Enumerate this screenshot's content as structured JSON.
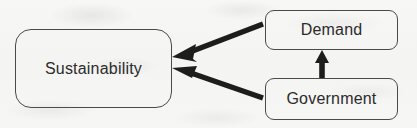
{
  "diagram": {
    "type": "flow-diagram",
    "background_color": "#f6f6f4",
    "stroke_color": "#2b2b2b",
    "box_border_color": "#4a4a4a",
    "nodes": [
      {
        "id": "sustainability",
        "label": "Sustainability",
        "shape": "rounded-rectangle"
      },
      {
        "id": "demand",
        "label": "Demand",
        "shape": "rounded-rectangle"
      },
      {
        "id": "government",
        "label": "Government",
        "shape": "rounded-rectangle"
      }
    ],
    "edges": [
      {
        "id": "demand-to-sustainability",
        "from": "Demand",
        "to": "Sustainability",
        "direction": "left",
        "style": "solid-thick-arrow"
      },
      {
        "id": "government-to-sustainability",
        "from": "Government",
        "to": "Sustainability",
        "direction": "left",
        "style": "solid-thick-arrow"
      },
      {
        "id": "government-to-demand",
        "from": "Government",
        "to": "Demand",
        "direction": "up",
        "style": "solid-thick-arrow"
      }
    ]
  }
}
